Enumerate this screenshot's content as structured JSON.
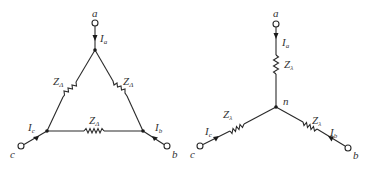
{
  "delta": {
    "terminals": {
      "a": "a",
      "b": "b",
      "c": "c"
    },
    "currents": {
      "a": {
        "main": "I",
        "sub": "a"
      },
      "b": {
        "main": "I",
        "sub": "b"
      },
      "c": {
        "main": "I",
        "sub": "c"
      }
    },
    "impedances": [
      {
        "main": "Z",
        "sub": "Δ"
      },
      {
        "main": "Z",
        "sub": "Δ"
      },
      {
        "main": "Z",
        "sub": "Δ"
      }
    ]
  },
  "wye": {
    "terminals": {
      "a": "a",
      "b": "b",
      "c": "c"
    },
    "neutral": "n",
    "currents": {
      "a": {
        "main": "I",
        "sub": "a"
      },
      "b": {
        "main": "I",
        "sub": "b"
      },
      "c": {
        "main": "I",
        "sub": "c"
      }
    },
    "impedances": [
      {
        "main": "Z",
        "sub": "λ"
      },
      {
        "main": "Z",
        "sub": "λ"
      },
      {
        "main": "Z",
        "sub": "λ"
      }
    ]
  }
}
